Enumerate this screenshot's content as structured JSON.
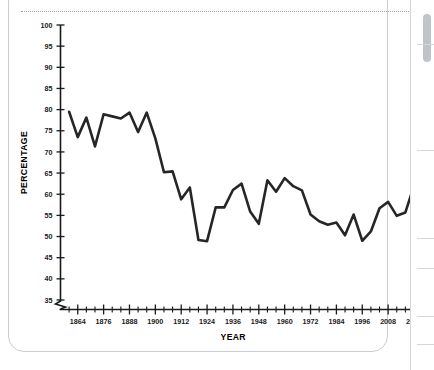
{
  "chart_data": {
    "type": "line",
    "title": "",
    "xlabel": "YEAR",
    "ylabel": "PERCENTAGE",
    "xlim": [
      1856,
      2020
    ],
    "ylim": [
      35,
      100
    ],
    "y_axis_break": true,
    "grid": false,
    "legend": null,
    "x_tick_labels": [
      "1864",
      "1876",
      "1888",
      "1900",
      "1912",
      "1924",
      "1936",
      "1948",
      "1960",
      "1972",
      "1984",
      "1996",
      "2008",
      "2020"
    ],
    "x_tick_values": [
      1864,
      1876,
      1888,
      1900,
      1912,
      1924,
      1936,
      1948,
      1960,
      1972,
      1984,
      1996,
      2008,
      2020
    ],
    "x_minor_step": 4,
    "y_tick_labels": [
      "35",
      "40",
      "45",
      "50",
      "55",
      "60",
      "65",
      "70",
      "75",
      "80",
      "85",
      "90",
      "95",
      "100"
    ],
    "y_tick_values": [
      35,
      40,
      45,
      50,
      55,
      60,
      65,
      70,
      75,
      80,
      85,
      90,
      95,
      100
    ],
    "series": [
      {
        "name": "Percentage",
        "color": "#262626",
        "x": [
          1860,
          1864,
          1868,
          1872,
          1876,
          1880,
          1884,
          1888,
          1892,
          1896,
          1900,
          1904,
          1908,
          1912,
          1916,
          1920,
          1924,
          1928,
          1932,
          1936,
          1940,
          1944,
          1948,
          1952,
          1956,
          1960,
          1964,
          1968,
          1972,
          1976,
          1980,
          1984,
          1988,
          1992,
          1996,
          2000,
          2004,
          2008,
          2012,
          2016,
          2020
        ],
        "values": [
          79.5,
          73.5,
          78.1,
          71.3,
          78.9,
          78.4,
          77.9,
          79.3,
          74.7,
          79.3,
          73.2,
          65.2,
          65.4,
          58.8,
          61.6,
          49.2,
          48.9,
          56.9,
          56.9,
          61.0,
          62.5,
          55.9,
          53.0,
          63.3,
          60.6,
          63.8,
          61.9,
          60.9,
          55.2,
          53.6,
          52.8,
          53.3,
          50.3,
          55.2,
          49.0,
          51.2,
          56.7,
          58.2,
          54.9,
          55.7,
          62.0
        ]
      }
    ]
  },
  "axis_titles": {
    "x": "YEAR",
    "y": "PERCENTAGE"
  }
}
